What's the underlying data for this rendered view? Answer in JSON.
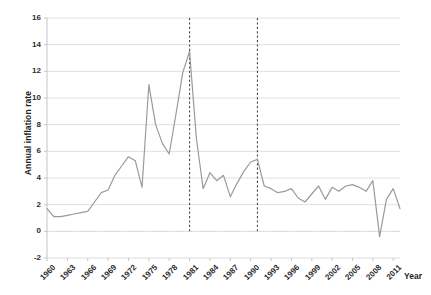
{
  "chart_data": {
    "type": "line",
    "title": "",
    "xlabel": "Year",
    "ylabel": "Annual inflation rate",
    "ylim": [
      -2,
      16
    ],
    "yticks": [
      -2,
      0,
      2,
      4,
      6,
      8,
      10,
      12,
      14,
      16
    ],
    "xlim": [
      1960,
      2012
    ],
    "xticks": [
      1960,
      1963,
      1966,
      1969,
      1972,
      1975,
      1978,
      1981,
      1984,
      1987,
      1990,
      1993,
      1996,
      1999,
      2002,
      2005,
      2008,
      2011
    ],
    "grid": "horizontal",
    "legend": "none",
    "line_color": "#9a9a9a",
    "grid_color": "#d9d9d9",
    "axis_color": "#bfbfbf",
    "annotation_line_color": "#4a4a4a",
    "annotations": [
      {
        "type": "vline",
        "x": 1981,
        "style": "dashed"
      },
      {
        "type": "vline",
        "x": 1991,
        "style": "dashed"
      }
    ],
    "x": [
      1960,
      1961,
      1962,
      1963,
      1964,
      1965,
      1966,
      1967,
      1968,
      1969,
      1970,
      1971,
      1972,
      1973,
      1974,
      1975,
      1976,
      1977,
      1978,
      1979,
      1980,
      1981,
      1982,
      1983,
      1984,
      1985,
      1986,
      1987,
      1988,
      1989,
      1990,
      1991,
      1992,
      1993,
      1994,
      1995,
      1996,
      1997,
      1998,
      1999,
      2000,
      2001,
      2002,
      2003,
      2004,
      2005,
      2006,
      2007,
      2008,
      2009,
      2010,
      2011,
      2012
    ],
    "values": [
      1.7,
      1.1,
      1.1,
      1.2,
      1.3,
      1.4,
      1.5,
      2.2,
      2.9,
      3.1,
      4.2,
      4.9,
      5.6,
      5.3,
      3.3,
      11.0,
      8.0,
      6.6,
      5.8,
      8.8,
      11.9,
      13.5,
      7.0,
      3.2,
      4.4,
      3.8,
      4.2,
      2.6,
      3.6,
      4.5,
      5.2,
      5.4,
      3.4,
      3.2,
      2.9,
      3.0,
      3.2,
      2.5,
      2.2,
      2.8,
      3.4,
      2.4,
      3.3,
      3.0,
      3.4,
      3.5,
      3.3,
      3.0,
      3.8,
      -0.4,
      2.4,
      3.2,
      1.7
    ]
  }
}
